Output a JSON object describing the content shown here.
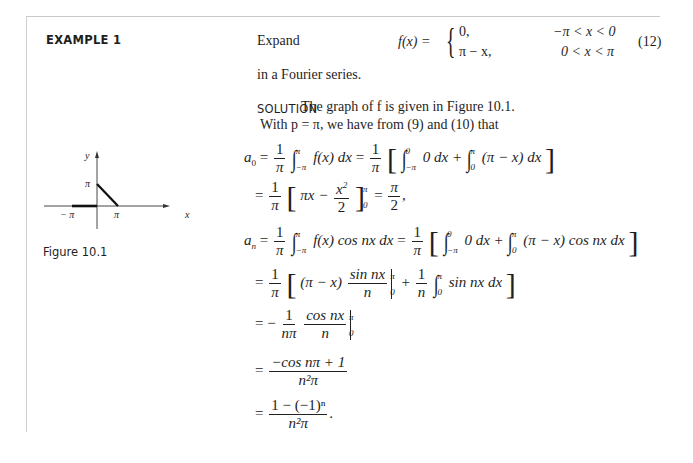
{
  "example_label": "EXAMPLE 1",
  "intro": {
    "expand": "Expand",
    "lhs": "f(x) = ",
    "brace": "{",
    "case1_value": "0,",
    "case1_condition": "−π < x < 0",
    "case2_value": "π − x,",
    "case2_condition": "0 < x < π",
    "equation_number": "(12)",
    "continuation": "in a Fourier series."
  },
  "solution": {
    "label": "SOLUTION",
    "line1": "The graph of f is given in Figure 10.1.",
    "line2": "With p = π, we have from (9) and (10) that"
  },
  "figure": {
    "caption": "Figure 10.1",
    "y_axis_label": "y",
    "x_axis_label": "x",
    "y_tick": "π",
    "x_tick_neg": "− π",
    "x_tick_pos": "π"
  },
  "equations": {
    "a0_line1": {
      "lhs": "a",
      "lhs_sub": "0",
      "eq": "=",
      "one": "1",
      "pi": "π",
      "int_upper": "π",
      "int_lower": "−π",
      "integrand": "f(x) dx",
      "int2_upper": "0",
      "int2_lower": "−π",
      "integrand2": "0 dx +",
      "int3_upper": "π",
      "int3_lower": "0",
      "integrand3": "(π − x) dx"
    },
    "a0_line2": {
      "eq": "=",
      "one": "1",
      "pi": "π",
      "expr_left": "πx −",
      "x2": "x",
      "exp2": "2",
      "two": "2",
      "upper": "π",
      "lower": "0",
      "result_num": "π",
      "result_den": "2",
      "tail": ","
    },
    "an_line1": {
      "lhs": "a",
      "lhs_sub": "n",
      "eq": "=",
      "one": "1",
      "pi": "π",
      "int_upper": "π",
      "int_lower": "−π",
      "integrand": "f(x) cos nx dx",
      "int2_upper": "0",
      "int2_lower": "−π",
      "integrand2": "0 dx +",
      "int3_upper": "π",
      "int3_lower": "0",
      "integrand3": "(π − x) cos nx dx"
    },
    "an_line2": {
      "eq": "=",
      "one": "1",
      "pi": "π",
      "expr": "(π − x)",
      "sin_num": "sin nx",
      "n_den": "n",
      "upper": "π",
      "lower": "0",
      "plus": "+",
      "one_b": "1",
      "n_b": "n",
      "int_upper": "π",
      "int_lower": "0",
      "integrand": "sin nx dx"
    },
    "an_line3": {
      "eq": "= −",
      "one": "1",
      "npi": "nπ",
      "cos_num": "cos nx",
      "n_den": "n",
      "upper": "π",
      "lower": "0"
    },
    "an_line4": {
      "eq": "=",
      "num": "−cos nπ + 1",
      "den": "n²π"
    },
    "an_line5": {
      "eq": "=",
      "num": "1 − (−1)ⁿ",
      "den": "n²π",
      "tail": "."
    }
  }
}
